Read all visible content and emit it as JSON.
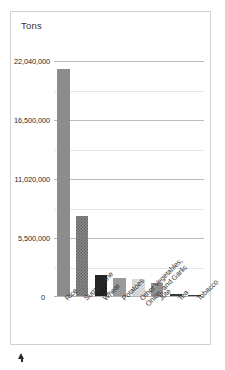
{
  "chart_data": {
    "type": "bar",
    "title": "",
    "ylabel": "Tons",
    "xlabel": "",
    "ylim": [
      0,
      24000000
    ],
    "grid": true,
    "legend": "none",
    "categories": [
      "Rice",
      "Sugar Cane",
      "Wheat",
      "Potatoes",
      "Other Vegetables, Onion, and Garlic",
      "Jute",
      "Tea",
      "Tobacco"
    ],
    "category_lines": [
      [
        "Rice"
      ],
      [
        "Sugar Cane"
      ],
      [
        "Wheat"
      ],
      [
        "Potatoes"
      ],
      [
        "Other Vegetables,",
        "Onion, and Garlic"
      ],
      [
        "Jute"
      ],
      [
        "Tea"
      ],
      [
        "Tobacco"
      ]
    ],
    "values": [
      21300000,
      7600000,
      2100000,
      1750000,
      1700000,
      1300000,
      270000,
      200000
    ],
    "ytick_labels": [
      "0",
      "5,500,000",
      "11,020,000",
      "16,500,000",
      "22,040,000"
    ],
    "ytick_values": [
      0,
      5500000,
      11020000,
      16500000,
      22040000
    ],
    "bar_fills": [
      "solid-gray",
      "hatch-gray",
      "dark",
      "mid-gray",
      "check-light",
      "gray-2",
      "near-black",
      "near-black"
    ],
    "colors": {
      "solid-gray": "#8c8c8c",
      "hatch-gray": "#8a8a8a",
      "dark": "#242424",
      "mid-gray": "#9a9a9a",
      "check-light": "#e3e3e3",
      "gray-2": "#8f8f8f",
      "near-black": "#3a3a3a",
      "gridline": "#e6e6e6",
      "gridline_major": "#bcbcbc",
      "frame_border": "#d2d2d2",
      "text": "#2b2b2b",
      "marker": "#2a2a2a"
    }
  },
  "axis": {
    "title": "Tons",
    "zero_label": "0"
  },
  "marker": {
    "name": "triangle-pointer"
  }
}
